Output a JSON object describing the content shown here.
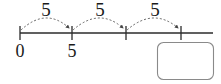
{
  "diagram": {
    "kind": "number-line-skip-counting",
    "colors": {
      "line": "#2b2b2b",
      "arc": "#555555",
      "text": "#1a1a1a",
      "box_border": "#8a8a8a",
      "box_fill": "#ffffff",
      "background": "#ffffff"
    },
    "number_line": {
      "start_x": 20,
      "end_x": 213,
      "y": 33,
      "ticks": [
        {
          "x": 20,
          "label": "0",
          "label_shown": true
        },
        {
          "x": 72,
          "label": "5",
          "label_shown": true
        },
        {
          "x": 126,
          "label": "",
          "label_shown": false
        },
        {
          "x": 181,
          "label": "",
          "label_shown": false
        }
      ]
    },
    "jumps": [
      {
        "label": "5",
        "from_x": 20,
        "to_x": 72,
        "label_x": 46,
        "label_y": 16
      },
      {
        "label": "5",
        "from_x": 72,
        "to_x": 126,
        "label_x": 100,
        "label_y": 16
      },
      {
        "label": "5",
        "from_x": 126,
        "to_x": 181,
        "label_x": 155,
        "label_y": 16
      }
    ],
    "answer_box": {
      "x": 157,
      "y": 42,
      "width": 56,
      "height": 37,
      "radius": 6,
      "value": "",
      "placeholder": ""
    }
  },
  "chart_data": {
    "type": "line",
    "title": "",
    "xlabel": "",
    "ylabel": "",
    "categories": [
      "0",
      "5",
      "",
      ""
    ],
    "values": [
      0,
      5,
      10,
      15
    ],
    "annotations": [
      "5",
      "5",
      "5"
    ]
  }
}
